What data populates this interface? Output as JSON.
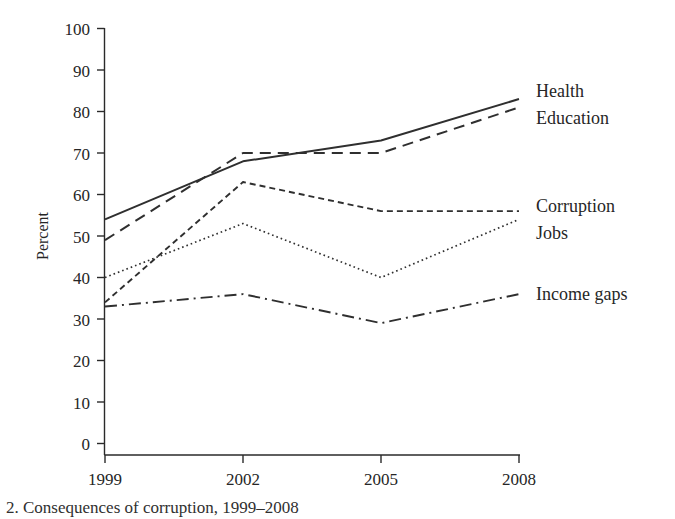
{
  "chart_data": {
    "type": "line",
    "title": "",
    "xlabel": "",
    "ylabel": "Percent",
    "x": [
      "1999",
      "2002",
      "2005",
      "2008"
    ],
    "categories": [
      "1999",
      "2002",
      "2005",
      "2008"
    ],
    "xtick_labels": [
      "1999",
      "2002",
      "2005",
      "2008"
    ],
    "ytick_labels": [
      "0",
      "10",
      "20",
      "30",
      "40",
      "50",
      "60",
      "70",
      "80",
      "90",
      "100"
    ],
    "yticks": [
      0,
      10,
      20,
      30,
      40,
      50,
      60,
      70,
      80,
      90,
      100
    ],
    "ylim": [
      0,
      100
    ],
    "grid": false,
    "legend_position": "right-of-plot-endpoints",
    "series": [
      {
        "name": "Health",
        "linestyle": "solid",
        "values": [
          54,
          68,
          73,
          83
        ]
      },
      {
        "name": "Education",
        "linestyle": "dashed",
        "values": [
          49,
          70,
          70,
          81
        ]
      },
      {
        "name": "Corruption",
        "linestyle": "small-dashed",
        "values": [
          34,
          63,
          56,
          56
        ]
      },
      {
        "name": "Jobs",
        "linestyle": "dotted",
        "values": [
          40,
          53,
          40,
          54
        ]
      },
      {
        "name": "Income gaps",
        "linestyle": "dash-dot",
        "values": [
          33,
          36,
          29,
          36
        ]
      }
    ],
    "series_labels": [
      {
        "name": "Health",
        "x": 536,
        "y": 97
      },
      {
        "name": "Education",
        "x": 536,
        "y": 124
      },
      {
        "name": "Corruption",
        "x": 536,
        "y": 212
      },
      {
        "name": "Jobs",
        "x": 536,
        "y": 239
      },
      {
        "name": "Income gaps",
        "x": 536,
        "y": 300
      }
    ],
    "annotations": []
  },
  "axes": {
    "y_axis_title": "Percent",
    "y_ticks": [
      {
        "label": "100",
        "value": 100
      },
      {
        "label": "90",
        "value": 90
      },
      {
        "label": "80",
        "value": 80
      },
      {
        "label": "70",
        "value": 70
      },
      {
        "label": "60",
        "value": 60
      },
      {
        "label": "50",
        "value": 50
      },
      {
        "label": "40",
        "value": 40
      },
      {
        "label": "30",
        "value": 30
      },
      {
        "label": "20",
        "value": 20
      },
      {
        "label": "10",
        "value": 10
      },
      {
        "label": "0",
        "value": 0
      }
    ],
    "x_ticks": [
      {
        "label": "1999"
      },
      {
        "label": "2002"
      },
      {
        "label": "2005"
      },
      {
        "label": "2008"
      }
    ]
  },
  "caption": {
    "text": "2. Consequences of corruption, 1999–2008"
  },
  "colors": {
    "ink": "#2a2a2a",
    "background": "#ffffff"
  }
}
